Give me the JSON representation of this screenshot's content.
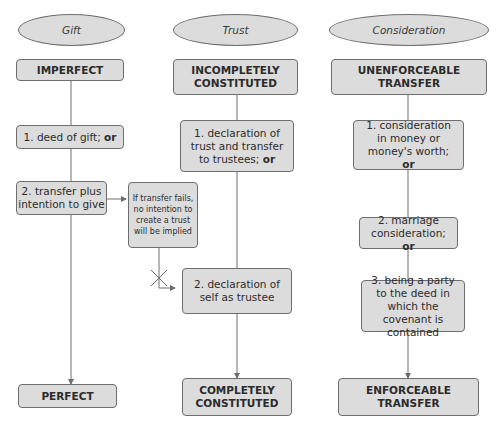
{
  "columns": {
    "gift": {
      "title": "Gift",
      "start": "IMPERFECT",
      "steps": [
        {
          "text": "1. deed of gift; ",
          "connector": "or"
        },
        {
          "text": "2. transfer plus intention to give",
          "connector": ""
        }
      ],
      "end": "PERFECT"
    },
    "trust": {
      "title": "Trust",
      "start": "INCOMPLETELY CONSTITUTED",
      "steps": [
        {
          "text": "1. declaration of trust and transfer to trustees; ",
          "connector": "or"
        },
        {
          "text": "2. declaration of self as trustee",
          "connector": ""
        }
      ],
      "end": "COMPLETELY CONSTITUTED"
    },
    "consideration": {
      "title": "Consideration",
      "start": "UNENFORCEABLE TRANSFER",
      "steps": [
        {
          "text": "1. consideration in money or money's worth; ",
          "connector": "or"
        },
        {
          "text": "2. marriage consideration; ",
          "connector": "or"
        },
        {
          "text": "3. being a party to the deed in which the covenant is contained",
          "connector": ""
        }
      ],
      "end": "ENFORCEABLE TRANSFER"
    }
  },
  "side_note": "If transfer fails, no intention to create a trust will be implied",
  "colors": {
    "box_fill": "#dcdcdc",
    "box_border": "#6e6e6e",
    "line": "#6e6e6e"
  }
}
